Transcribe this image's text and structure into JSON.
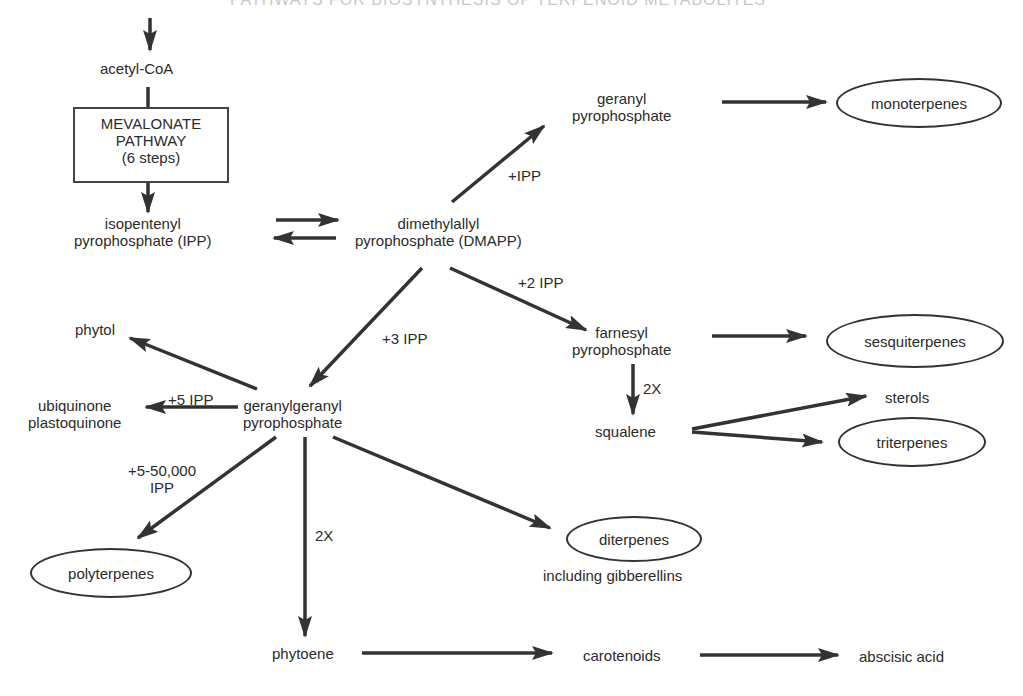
{
  "title": "PATHWAYS FOR BIOSYNTHESIS OF TERPENOID METABOLITES",
  "nodes": {
    "acetyl_coa": "acetyl-CoA",
    "mevalonate_box": {
      "line1": "MEVALONATE",
      "line2": "PATHWAY",
      "line3": "(6 steps)"
    },
    "ipp": {
      "line1": "isopentenyl",
      "line2": "pyrophosphate (IPP)"
    },
    "dmapp": {
      "line1": "dimethylallyl",
      "line2": "pyrophosphate (DMAPP)"
    },
    "gpp": {
      "line1": "geranyl",
      "line2": "pyrophosphate"
    },
    "monoterpenes": "monoterpenes",
    "fpp": {
      "line1": "farnesyl",
      "line2": "pyrophosphate"
    },
    "sesquiterpenes": "sesquiterpenes",
    "squalene": "squalene",
    "sterols": "sterols",
    "triterpenes": "triterpenes",
    "ggpp": {
      "line1": "geranylgeranyl",
      "line2": "pyrophosphate"
    },
    "phytol": "phytol",
    "quinones": {
      "line1": "ubiquinone",
      "line2": "plastoquinone"
    },
    "polyterpenes": "polyterpenes",
    "diterpenes": "diterpenes",
    "diterpenes_note": "including gibberellins",
    "phytoene": "phytoene",
    "carotenoids": "carotenoids",
    "abscisic_acid": "abscisic acid"
  },
  "edge_labels": {
    "to_gpp": "+IPP",
    "to_fpp": "+2 IPP",
    "to_ggpp": "+3 IPP",
    "to_quinones": "+5 IPP",
    "to_polyterpenes_1": "+5-50,000",
    "to_polyterpenes_2": "IPP",
    "to_squalene": "2X",
    "to_phytoene": "2X"
  },
  "colors": {
    "arrow": "#333333",
    "text": "#2b2b2b",
    "background": "#ffffff"
  }
}
